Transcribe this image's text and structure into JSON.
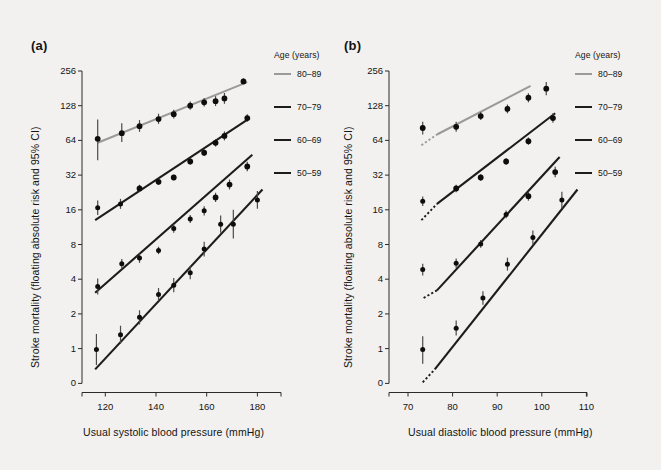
{
  "figure": {
    "background": "#f2f1ef",
    "panels": [
      {
        "id": "a",
        "label": "(a)",
        "xlabel": "Usual systolic blood pressure (mmHg)",
        "ylabel": "Stroke mortality (floating absolute risk and 95% CI)",
        "xticks": [
          "120",
          "140",
          "160",
          "180"
        ],
        "yticks": [
          "256",
          "128",
          "64",
          "32",
          "16",
          "8",
          "4",
          "2",
          "1",
          "0"
        ]
      },
      {
        "id": "b",
        "label": "(b)",
        "xlabel": "Usual diastolic blood pressure (mmHg)",
        "ylabel": "Stroke mortality (floating absolute risk and 95% CI)",
        "xticks": [
          "70",
          "80",
          "90",
          "100",
          "110"
        ],
        "yticks": [
          "256",
          "128",
          "64",
          "32",
          "16",
          "8",
          "4",
          "2",
          "1",
          "0"
        ]
      }
    ],
    "legend": {
      "title": "Age (years)",
      "entries": [
        {
          "label": "80–89",
          "color": "#9a9a9a",
          "width": 2.6
        },
        {
          "label": "70–79",
          "color": "#1c1c1c",
          "width": 2.6
        },
        {
          "label": "60–69",
          "color": "#1c1c1c",
          "width": 2.6
        },
        {
          "label": "50–59",
          "color": "#1c1c1c",
          "width": 2.6
        }
      ]
    }
  },
  "chart_data": [
    {
      "type": "scatter",
      "panel": "(a)",
      "title": "Stroke mortality rate vs usual systolic blood pressure, by age at risk",
      "xlabel": "Usual systolic blood pressure (mmHg)",
      "ylabel": "Stroke mortality (floating absolute risk and 95% CI)",
      "xlim": [
        112,
        190
      ],
      "ylim": [
        0.5,
        300
      ],
      "yscale": "log2",
      "xticks": [
        120,
        140,
        160,
        180
      ],
      "yticks": [
        0,
        1,
        2,
        4,
        8,
        16,
        32,
        64,
        128,
        256
      ],
      "grid": false,
      "legend_position": "right",
      "series": [
        {
          "name": "80–89",
          "color": "#9a9a9a",
          "fit_line": {
            "x": [
              117,
              176
            ],
            "y": [
              61,
              205
            ]
          },
          "points": [
            {
              "x": 117.0,
              "y": 66,
              "ci_low": 43,
              "ci_high": 97
            },
            {
              "x": 126.5,
              "y": 74,
              "ci_low": 62,
              "ci_high": 90
            },
            {
              "x": 133.5,
              "y": 85,
              "ci_low": 76,
              "ci_high": 96
            },
            {
              "x": 141.0,
              "y": 98,
              "ci_low": 89,
              "ci_high": 109
            },
            {
              "x": 147.0,
              "y": 108,
              "ci_low": 99,
              "ci_high": 118
            },
            {
              "x": 153.5,
              "y": 128,
              "ci_low": 118,
              "ci_high": 139
            },
            {
              "x": 159.0,
              "y": 137,
              "ci_low": 126,
              "ci_high": 149
            },
            {
              "x": 163.5,
              "y": 140,
              "ci_low": 127,
              "ci_high": 155
            },
            {
              "x": 167.0,
              "y": 148,
              "ci_low": 133,
              "ci_high": 165
            },
            {
              "x": 174.5,
              "y": 208,
              "ci_low": 196,
              "ci_high": 221
            }
          ]
        },
        {
          "name": "70–79",
          "color": "#1c1c1c",
          "fit_line": {
            "x": [
              116,
              177
            ],
            "y": [
              13.0,
              100
            ]
          },
          "points": [
            {
              "x": 117.0,
              "y": 16.7,
              "ci_low": 14.4,
              "ci_high": 19.3
            },
            {
              "x": 126.0,
              "y": 18.0,
              "ci_low": 16.3,
              "ci_high": 19.9
            },
            {
              "x": 133.5,
              "y": 24.5,
              "ci_low": 22.8,
              "ci_high": 26.4
            },
            {
              "x": 141.0,
              "y": 28.0,
              "ci_low": 26.3,
              "ci_high": 29.8
            },
            {
              "x": 147.0,
              "y": 30.5,
              "ci_low": 28.8,
              "ci_high": 32.3
            },
            {
              "x": 153.5,
              "y": 42.0,
              "ci_low": 39.5,
              "ci_high": 44.7
            },
            {
              "x": 159.0,
              "y": 50.0,
              "ci_low": 46.9,
              "ci_high": 53.3
            },
            {
              "x": 163.5,
              "y": 61.0,
              "ci_low": 56.6,
              "ci_high": 65.8
            },
            {
              "x": 167.0,
              "y": 70.0,
              "ci_low": 64.0,
              "ci_high": 76.6
            },
            {
              "x": 176.0,
              "y": 100.0,
              "ci_low": 93.0,
              "ci_high": 108.0
            }
          ]
        },
        {
          "name": "60–69",
          "color": "#1c1c1c",
          "fit_line": {
            "x": [
              116,
              178
            ],
            "y": [
              3.05,
              48
            ]
          },
          "points": [
            {
              "x": 117.0,
              "y": 3.45,
              "ci_low": 2.95,
              "ci_high": 4.05
            },
            {
              "x": 126.5,
              "y": 5.45,
              "ci_low": 4.95,
              "ci_high": 6.0
            },
            {
              "x": 133.5,
              "y": 6.1,
              "ci_low": 5.55,
              "ci_high": 6.7
            },
            {
              "x": 141.0,
              "y": 7.1,
              "ci_low": 6.6,
              "ci_high": 7.65
            },
            {
              "x": 147.0,
              "y": 11.0,
              "ci_low": 10.1,
              "ci_high": 12.0
            },
            {
              "x": 153.5,
              "y": 13.3,
              "ci_low": 12.3,
              "ci_high": 14.4
            },
            {
              "x": 159.0,
              "y": 15.7,
              "ci_low": 14.3,
              "ci_high": 17.2
            },
            {
              "x": 163.5,
              "y": 20.5,
              "ci_low": 18.7,
              "ci_high": 22.5
            },
            {
              "x": 169.0,
              "y": 26.5,
              "ci_low": 24.0,
              "ci_high": 29.3
            },
            {
              "x": 176.0,
              "y": 38.0,
              "ci_low": 34.6,
              "ci_high": 41.8
            }
          ]
        },
        {
          "name": "50–59",
          "color": "#1c1c1c",
          "fit_line": {
            "x": [
              116,
              182
            ],
            "y": [
              0.66,
              24
            ]
          },
          "points": [
            {
              "x": 116.5,
              "y": 0.98,
              "ci_low": 0.72,
              "ci_high": 1.34
            },
            {
              "x": 126.0,
              "y": 1.32,
              "ci_low": 1.1,
              "ci_high": 1.58
            },
            {
              "x": 133.5,
              "y": 1.87,
              "ci_low": 1.62,
              "ci_high": 2.15
            },
            {
              "x": 141.0,
              "y": 2.95,
              "ci_low": 2.6,
              "ci_high": 3.35
            },
            {
              "x": 147.0,
              "y": 3.55,
              "ci_low": 3.08,
              "ci_high": 4.1
            },
            {
              "x": 153.5,
              "y": 4.55,
              "ci_low": 4.0,
              "ci_high": 5.2
            },
            {
              "x": 159.0,
              "y": 7.3,
              "ci_low": 6.3,
              "ci_high": 8.45
            },
            {
              "x": 165.5,
              "y": 12.0,
              "ci_low": 10.1,
              "ci_high": 14.3
            },
            {
              "x": 170.5,
              "y": 12.0,
              "ci_low": 9.0,
              "ci_high": 16.0
            },
            {
              "x": 180.0,
              "y": 19.5,
              "ci_low": 16.3,
              "ci_high": 23.3
            }
          ]
        }
      ]
    },
    {
      "type": "scatter",
      "panel": "(b)",
      "title": "Stroke mortality rate vs usual diastolic blood pressure, by age at risk",
      "xlabel": "Usual diastolic blood pressure (mmHg)",
      "ylabel": "Stroke mortality (floating absolute risk and 95% CI)",
      "xlim": [
        66,
        115
      ],
      "ylim": [
        0.5,
        300
      ],
      "yscale": "log2",
      "xticks": [
        70,
        80,
        90,
        100,
        110
      ],
      "yticks": [
        0,
        1,
        2,
        4,
        8,
        16,
        32,
        64,
        128,
        256
      ],
      "grid": false,
      "legend_position": "right",
      "series": [
        {
          "name": "80–89",
          "color": "#9a9a9a",
          "fit_line": {
            "x": [
              76.5,
              97.5
            ],
            "y": [
              72,
              190
            ]
          },
          "dotted_extension": {
            "x": [
              73.0,
              76.5
            ],
            "y": [
              58,
              72
            ]
          },
          "points": [
            {
              "x": 73.3,
              "y": 82,
              "ci_low": 72,
              "ci_high": 93
            },
            {
              "x": 80.8,
              "y": 84,
              "ci_low": 76,
              "ci_high": 93
            },
            {
              "x": 86.3,
              "y": 104,
              "ci_low": 96,
              "ci_high": 113
            },
            {
              "x": 92.3,
              "y": 120,
              "ci_low": 110,
              "ci_high": 131
            },
            {
              "x": 97.0,
              "y": 150,
              "ci_low": 137,
              "ci_high": 164
            },
            {
              "x": 101.0,
              "y": 180,
              "ci_low": 158,
              "ci_high": 205
            }
          ]
        },
        {
          "name": "70–79",
          "color": "#1c1c1c",
          "fit_line": {
            "x": [
              76.5,
              103.0
            ],
            "y": [
              18,
              110
            ]
          },
          "dotted_extension": {
            "x": [
              73.0,
              76.5
            ],
            "y": [
              13.0,
              18
            ]
          },
          "points": [
            {
              "x": 73.3,
              "y": 19.0,
              "ci_low": 17.3,
              "ci_high": 20.9
            },
            {
              "x": 80.8,
              "y": 24.5,
              "ci_low": 22.7,
              "ci_high": 26.4
            },
            {
              "x": 86.3,
              "y": 30.5,
              "ci_low": 28.6,
              "ci_high": 32.5
            },
            {
              "x": 92.0,
              "y": 42.0,
              "ci_low": 39.3,
              "ci_high": 44.9
            },
            {
              "x": 97.0,
              "y": 63.0,
              "ci_low": 58.5,
              "ci_high": 67.8
            },
            {
              "x": 102.5,
              "y": 100.0,
              "ci_low": 91.0,
              "ci_high": 110.0
            }
          ]
        },
        {
          "name": "60–69",
          "color": "#1c1c1c",
          "fit_line": {
            "x": [
              76.5,
              104.0
            ],
            "y": [
              3.2,
              46
            ]
          },
          "dotted_extension": {
            "x": [
              73.5,
              76.5
            ],
            "y": [
              2.75,
              3.2
            ]
          },
          "points": [
            {
              "x": 73.3,
              "y": 4.85,
              "ci_low": 4.3,
              "ci_high": 5.45
            },
            {
              "x": 80.8,
              "y": 5.5,
              "ci_low": 5.0,
              "ci_high": 6.05
            },
            {
              "x": 86.3,
              "y": 8.1,
              "ci_low": 7.5,
              "ci_high": 8.75
            },
            {
              "x": 92.0,
              "y": 14.6,
              "ci_low": 13.5,
              "ci_high": 15.8
            },
            {
              "x": 97.0,
              "y": 21.0,
              "ci_low": 19.2,
              "ci_high": 23.0
            },
            {
              "x": 103.0,
              "y": 34.0,
              "ci_low": 30.6,
              "ci_high": 37.8
            }
          ]
        },
        {
          "name": "50–59",
          "color": "#1c1c1c",
          "fit_line": {
            "x": [
              76.0,
              108.0
            ],
            "y": [
              0.66,
              24
            ]
          },
          "dotted_extension": {
            "x": [
              73.3,
              76.0
            ],
            "y": [
              0.51,
              0.66
            ]
          },
          "points": [
            {
              "x": 73.3,
              "y": 0.98,
              "ci_low": 0.74,
              "ci_high": 1.28
            },
            {
              "x": 80.8,
              "y": 1.5,
              "ci_low": 1.3,
              "ci_high": 1.75
            },
            {
              "x": 86.8,
              "y": 2.75,
              "ci_low": 2.4,
              "ci_high": 3.15
            },
            {
              "x": 92.3,
              "y": 5.4,
              "ci_low": 4.75,
              "ci_high": 6.15
            },
            {
              "x": 98.0,
              "y": 9.2,
              "ci_low": 8.0,
              "ci_high": 10.6
            },
            {
              "x": 104.5,
              "y": 19.5,
              "ci_low": 16.5,
              "ci_high": 23.0
            }
          ]
        }
      ]
    }
  ]
}
